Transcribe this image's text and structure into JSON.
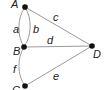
{
  "diagram": {
    "type": "multigraph",
    "nodes": [
      {
        "id": "A",
        "label": "A"
      },
      {
        "id": "B",
        "label": "B"
      },
      {
        "id": "C",
        "label": "C"
      },
      {
        "id": "D",
        "label": "D"
      }
    ],
    "edges": [
      {
        "id": "a",
        "label": "a",
        "from": "A",
        "to": "B"
      },
      {
        "id": "b",
        "label": "b",
        "from": "A",
        "to": "B"
      },
      {
        "id": "c",
        "label": "c",
        "from": "A",
        "to": "D"
      },
      {
        "id": "d",
        "label": "d",
        "from": "B",
        "to": "D"
      },
      {
        "id": "e",
        "label": "e",
        "from": "C",
        "to": "D"
      },
      {
        "id": "f",
        "label": "f",
        "from": "B",
        "to": "C"
      }
    ],
    "colors": {
      "edge": "#9a9a9a",
      "node": "#111111",
      "text": "#222222"
    }
  }
}
